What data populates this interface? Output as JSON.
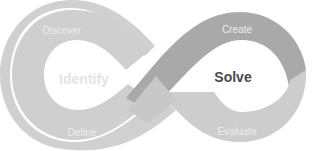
{
  "diagram": {
    "type": "infinity-loop",
    "left_loop": {
      "center_label": "Identify",
      "top_label": "Discover",
      "bottom_label": "Define",
      "color": "#cfcfcf",
      "center_label_color": "#e4e4e4"
    },
    "right_loop": {
      "center_label": "Solve",
      "top_label": "Create",
      "bottom_label": "Evaluate",
      "color_top": "#a9a9a9",
      "color_bottom": "#cdcdcd",
      "center_label_color": "#4a4a4a"
    }
  }
}
